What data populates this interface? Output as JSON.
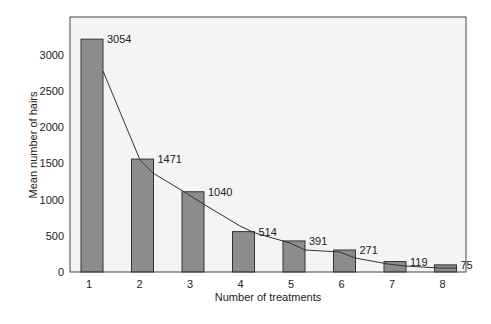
{
  "chart_data": {
    "type": "bar",
    "title": "",
    "xlabel": "Number of treatments",
    "ylabel": "Mean number of hairs",
    "categories": [
      "1",
      "2",
      "3",
      "4",
      "5",
      "6",
      "7",
      "8"
    ],
    "values": [
      3054,
      1471,
      1040,
      514,
      391,
      271,
      119,
      75
    ],
    "data_labels": [
      "3054",
      "1471",
      "1040",
      "514",
      "391",
      "271",
      "119",
      "75"
    ],
    "yticks": [
      0,
      500,
      1000,
      1500,
      2000,
      2500,
      3000
    ],
    "ylim": [
      0,
      3400
    ],
    "grid": false,
    "legend": null,
    "overlay": {
      "type": "line",
      "description": "trend line connecting bar tops"
    },
    "colors": {
      "bar_fill": "#8c8c8c",
      "bar_stroke": "#333333",
      "plot_bg": "#f4f4f4",
      "line": "#333333"
    }
  }
}
